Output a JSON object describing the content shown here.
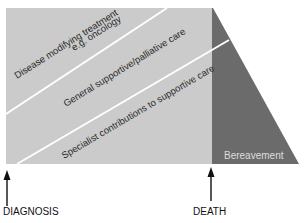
{
  "diagram": {
    "type": "palliative-care-continuum",
    "colors": {
      "care_region": "#cbcbcb",
      "bereavement_region": "#6b6b6b",
      "divider_lines": "#ffffff",
      "text": "#2a2a2a",
      "bereavement_text": "#dedede",
      "arrows": "#111111"
    },
    "bands": [
      {
        "label_line1": "Disease modifying treatment",
        "label_line2": "e.g. oncology"
      },
      {
        "label_line1": "General supportive/palliative care"
      },
      {
        "label_line1": "Specialist contributions to supportive care"
      }
    ],
    "bereavement": {
      "label": "Bereavement"
    },
    "markers": [
      {
        "label": "DIAGNOSIS"
      },
      {
        "label": "DEATH"
      }
    ]
  }
}
